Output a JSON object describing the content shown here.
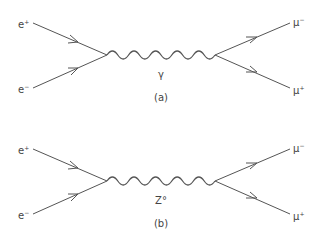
{
  "diagrams": [
    {
      "id": "a",
      "caption": "(a)",
      "mediator": "γ",
      "incoming": [
        {
          "base": "e",
          "charge": "+"
        },
        {
          "base": "e",
          "charge": "−"
        }
      ],
      "outgoing": [
        {
          "base": "μ",
          "charge": "−"
        },
        {
          "base": "μ",
          "charge": "+"
        }
      ]
    },
    {
      "id": "b",
      "caption": "(b)",
      "mediator": "Z°",
      "incoming": [
        {
          "base": "e",
          "charge": "+"
        },
        {
          "base": "e",
          "charge": "−"
        }
      ],
      "outgoing": [
        {
          "base": "μ",
          "charge": "−"
        },
        {
          "base": "μ",
          "charge": "+"
        }
      ]
    }
  ],
  "colors": {
    "stroke": "#555555",
    "text": "#444444"
  }
}
